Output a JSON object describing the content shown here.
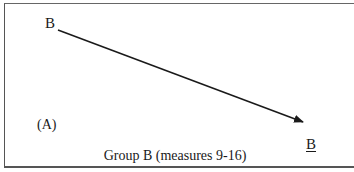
{
  "diagram": {
    "start_label": "B",
    "end_label": "B",
    "panel_label": "(A)",
    "caption": "Group B (measures 9-16)"
  }
}
